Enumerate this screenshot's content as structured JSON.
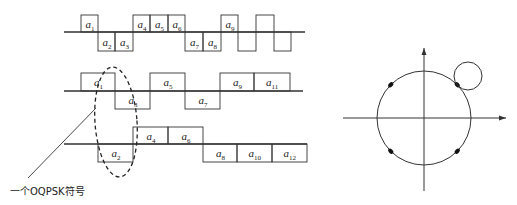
{
  "diagram": {
    "caption": "一个OQPSK符号",
    "colors": {
      "stroke": "#333333",
      "background": "#ffffff"
    },
    "waveforms": [
      {
        "name": "serial-data-stream",
        "baseline_y": 32,
        "top_y": 15,
        "bottom_y": 51,
        "line": [
          64,
          305
        ],
        "segments": [
          {
            "x0": 81,
            "x1": 98,
            "level": 1,
            "label": "a",
            "sub": "1"
          },
          {
            "x0": 98,
            "x1": 115,
            "level": -1,
            "label": "a",
            "sub": "2"
          },
          {
            "x0": 115,
            "x1": 133,
            "level": -1,
            "label": "a",
            "sub": "3"
          },
          {
            "x0": 133,
            "x1": 150,
            "level": 1,
            "label": "a",
            "sub": "4"
          },
          {
            "x0": 150,
            "x1": 168,
            "level": 1,
            "label": "a",
            "sub": "5"
          },
          {
            "x0": 168,
            "x1": 185,
            "level": 1,
            "label": "a",
            "sub": "6"
          },
          {
            "x0": 185,
            "x1": 203,
            "level": -1,
            "label": "a",
            "sub": "7"
          },
          {
            "x0": 203,
            "x1": 221,
            "level": -1,
            "label": "a",
            "sub": "8"
          },
          {
            "x0": 221,
            "x1": 238,
            "level": 1,
            "label": "a",
            "sub": "9"
          },
          {
            "x0": 238,
            "x1": 256,
            "level": -1,
            "label": "",
            "sub": ""
          },
          {
            "x0": 256,
            "x1": 274,
            "level": 1,
            "label": "",
            "sub": ""
          },
          {
            "x0": 274,
            "x1": 291,
            "level": -1,
            "label": "",
            "sub": ""
          }
        ]
      },
      {
        "name": "i-channel-odd",
        "baseline_y": 91,
        "top_y": 73,
        "bottom_y": 109,
        "line": [
          64,
          303
        ],
        "segments": [
          {
            "x0": 81,
            "x1": 115,
            "level": 1,
            "label": "a",
            "sub": "1"
          },
          {
            "x0": 115,
            "x1": 150,
            "level": -1,
            "label": "a",
            "sub": "3"
          },
          {
            "x0": 150,
            "x1": 185,
            "level": 1,
            "label": "a",
            "sub": "5"
          },
          {
            "x0": 185,
            "x1": 220,
            "level": -1,
            "label": "a",
            "sub": "7"
          },
          {
            "x0": 220,
            "x1": 254,
            "level": 1,
            "label": "a",
            "sub": "9"
          },
          {
            "x0": 254,
            "x1": 290,
            "level": 1,
            "label": "a",
            "sub": "11"
          }
        ]
      },
      {
        "name": "q-channel-even",
        "baseline_y": 144,
        "top_y": 127,
        "bottom_y": 162,
        "line": [
          64,
          307
        ],
        "segments": [
          {
            "x0": 98,
            "x1": 133,
            "level": -1,
            "label": "a",
            "sub": "2"
          },
          {
            "x0": 133,
            "x1": 168,
            "level": 1,
            "label": "a",
            "sub": "4"
          },
          {
            "x0": 168,
            "x1": 203,
            "level": 1,
            "label": "a",
            "sub": "6"
          },
          {
            "x0": 203,
            "x1": 237,
            "level": -1,
            "label": "a",
            "sub": "8"
          },
          {
            "x0": 237,
            "x1": 272,
            "level": -1,
            "label": "a",
            "sub": "10"
          },
          {
            "x0": 272,
            "x1": 307,
            "level": -1,
            "label": "a",
            "sub": "12"
          }
        ]
      }
    ],
    "symbol_highlight": {
      "cx": 116,
      "cy": 122,
      "rx": 21,
      "ry": 55,
      "style": "dashed"
    },
    "leader_line": {
      "x1": 28,
      "y1": 178,
      "x2": 96,
      "y2": 108
    },
    "constellation": {
      "origin": [
        424,
        118
      ],
      "radius": 47,
      "x_axis": [
        343,
        506
      ],
      "y_axis": [
        48,
        191
      ],
      "points_deg": [
        45,
        135,
        225,
        315
      ],
      "zoom_circle": {
        "cx": 468,
        "cy": 76,
        "r": 14
      }
    }
  }
}
